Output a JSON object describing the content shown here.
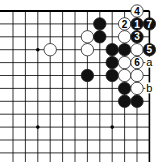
{
  "diagram": {
    "type": "go-board-fragment",
    "corner": "top-right",
    "grid": {
      "columns_x": [
        13,
        25.4,
        37.8,
        50.2,
        62.6,
        75,
        87.4,
        99.8,
        112.2,
        124.6,
        137,
        149.4
      ],
      "rows_y": [
        11,
        23.9,
        36.8,
        49.7,
        62.6,
        75.5,
        88.4,
        101.3,
        114.2,
        127.1,
        140,
        152.9
      ],
      "top_edge": true,
      "right_edge": true,
      "line_color": "#000000",
      "extend_left_to": 0,
      "extend_bottom_to": 162
    },
    "star_points": [
      {
        "col": 2,
        "row": 3
      },
      {
        "col": 2,
        "row": 9
      },
      {
        "col": 8,
        "row": 9
      }
    ],
    "stones": [
      {
        "color": "white",
        "col": 3,
        "row": 3,
        "label": ""
      },
      {
        "color": "white",
        "col": 6,
        "row": 2,
        "label": ""
      },
      {
        "color": "white",
        "col": 6,
        "row": 3,
        "label": ""
      },
      {
        "color": "black",
        "col": 7,
        "row": 1,
        "label": ""
      },
      {
        "color": "black",
        "col": 7,
        "row": 2,
        "label": ""
      },
      {
        "color": "black",
        "col": 6,
        "row": 5,
        "label": ""
      },
      {
        "color": "black",
        "col": 8,
        "row": 3,
        "label": ""
      },
      {
        "color": "black",
        "col": 8,
        "row": 4,
        "label": ""
      },
      {
        "color": "black",
        "col": 8,
        "row": 5,
        "label": ""
      },
      {
        "color": "black",
        "col": 9,
        "row": 3,
        "label": ""
      },
      {
        "color": "white",
        "col": 9,
        "row": 4,
        "label": ""
      },
      {
        "color": "white",
        "col": 9,
        "row": 5,
        "label": ""
      },
      {
        "color": "black",
        "col": 9,
        "row": 6,
        "label": ""
      },
      {
        "color": "black",
        "col": 9,
        "row": 7,
        "label": ""
      },
      {
        "color": "white",
        "col": 9,
        "row": 1,
        "label": "2"
      },
      {
        "color": "white",
        "col": 9,
        "row": 2,
        "label": ""
      },
      {
        "color": "white",
        "col": 10,
        "row": 0,
        "label": "4"
      },
      {
        "color": "black",
        "col": 10,
        "row": 1,
        "label": "1"
      },
      {
        "color": "black",
        "col": 10,
        "row": 2,
        "label": "3"
      },
      {
        "color": "white",
        "col": 10,
        "row": 3,
        "label": ""
      },
      {
        "color": "white",
        "col": 10,
        "row": 4,
        "label": "6"
      },
      {
        "color": "white",
        "col": 10,
        "row": 5,
        "label": ""
      },
      {
        "color": "white",
        "col": 10,
        "row": 6,
        "label": ""
      },
      {
        "color": "black",
        "col": 10,
        "row": 7,
        "label": ""
      },
      {
        "color": "black",
        "col": 11,
        "row": 1,
        "label": "7"
      },
      {
        "color": "black",
        "col": 11,
        "row": 3,
        "label": "5"
      }
    ],
    "point_labels": [
      {
        "col": 11,
        "row": 4,
        "text": "a"
      },
      {
        "col": 11,
        "row": 6,
        "text": "b"
      }
    ],
    "stone_radius": 6.2,
    "colors": {
      "black": "#111111",
      "white": "#ffffff",
      "outline": "#222222"
    }
  }
}
